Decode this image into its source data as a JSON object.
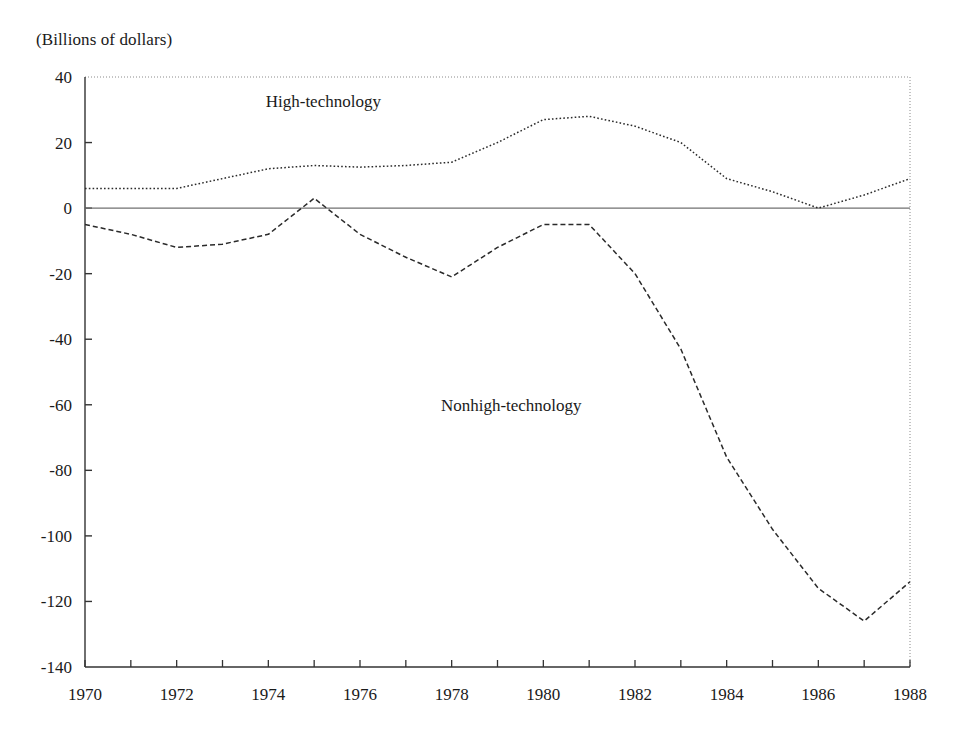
{
  "chart_data": {
    "type": "line",
    "title": "",
    "subtitle": "",
    "units_label": "(Billions of dollars)",
    "xlabel": "",
    "ylabel": "",
    "xlim": [
      1970,
      1988
    ],
    "ylim": [
      -140,
      40
    ],
    "y_ticks": [
      40,
      20,
      0,
      -20,
      -40,
      -60,
      -80,
      -100,
      -120,
      -140
    ],
    "y_tick_labels": [
      "40",
      "20",
      "0",
      "-20",
      "-40",
      "-60",
      "-80",
      "-100",
      "-120",
      "-140"
    ],
    "x_ticks": [
      1970,
      1971,
      1972,
      1973,
      1974,
      1975,
      1976,
      1977,
      1978,
      1979,
      1980,
      1981,
      1982,
      1983,
      1984,
      1985,
      1986,
      1987,
      1988
    ],
    "x_tick_labels_shown": [
      "1970",
      "1972",
      "1974",
      "1976",
      "1978",
      "1980",
      "1982",
      "1984",
      "1986",
      "1988"
    ],
    "x_minor_tick_interval": 1,
    "x_label_interval": 2,
    "grid": false,
    "zero_line": true,
    "legend_position": "inline-annotations",
    "x": [
      1970,
      1971,
      1972,
      1973,
      1974,
      1975,
      1976,
      1977,
      1978,
      1979,
      1980,
      1981,
      1982,
      1983,
      1984,
      1985,
      1986,
      1987,
      1988
    ],
    "series": [
      {
        "name": "High-technology",
        "line_style": "dotted",
        "color": "#2a2a2a",
        "label_x": 1975.2,
        "label_y": 31,
        "values": [
          6,
          6,
          6,
          9,
          12,
          13,
          12.5,
          13,
          14,
          20,
          27,
          28,
          25,
          20,
          9,
          5,
          0,
          4,
          9
        ]
      },
      {
        "name": "Nonhigh-technology",
        "line_style": "dashed",
        "color": "#2a2a2a",
        "label_x": 1979.3,
        "label_y": -62,
        "values": [
          -5,
          -8,
          -12,
          -11,
          -8,
          3,
          -8,
          -15,
          -21,
          -12,
          -5,
          -5,
          -20,
          -43,
          -76,
          -98,
          -116,
          -126,
          -114
        ]
      }
    ]
  }
}
